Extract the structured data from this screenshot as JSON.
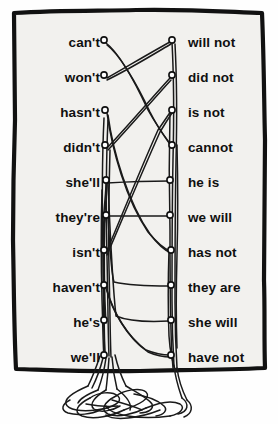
{
  "puzzle": {
    "title": "Contractions matching puzzle",
    "frame_color": "#111111",
    "background_color": "#f2f1ee",
    "string_color": "#1a1a1a",
    "text_color": "#101010",
    "rows": 10,
    "row_spacing": 35,
    "first_row_y": 43,
    "left_column": [
      {
        "label": "can't",
        "y": 43,
        "peg": {
          "x": 104,
          "y": 40
        }
      },
      {
        "label": "won't",
        "y": 78,
        "peg": {
          "x": 104,
          "y": 75
        }
      },
      {
        "label": "hasn't",
        "y": 113,
        "peg": {
          "x": 105,
          "y": 110
        }
      },
      {
        "label": "didn't",
        "y": 148,
        "peg": {
          "x": 105,
          "y": 145
        }
      },
      {
        "label": "she'll",
        "y": 183,
        "peg": {
          "x": 106,
          "y": 180
        }
      },
      {
        "label": "they're",
        "y": 218,
        "peg": {
          "x": 106,
          "y": 215
        }
      },
      {
        "label": "isn't",
        "y": 253,
        "peg": {
          "x": 104,
          "y": 250
        }
      },
      {
        "label": "haven't",
        "y": 288,
        "peg": {
          "x": 104,
          "y": 285
        }
      },
      {
        "label": "he's",
        "y": 323,
        "peg": {
          "x": 104,
          "y": 320
        }
      },
      {
        "label": "we'll",
        "y": 358,
        "peg": {
          "x": 104,
          "y": 355
        }
      }
    ],
    "right_column": [
      {
        "label": "will not",
        "y": 43,
        "peg": {
          "x": 172,
          "y": 40
        }
      },
      {
        "label": "did not",
        "y": 78,
        "peg": {
          "x": 172,
          "y": 75
        }
      },
      {
        "label": "is not",
        "y": 113,
        "peg": {
          "x": 172,
          "y": 110
        }
      },
      {
        "label": "cannot",
        "y": 148,
        "peg": {
          "x": 172,
          "y": 145
        }
      },
      {
        "label": "he is",
        "y": 183,
        "peg": {
          "x": 170,
          "y": 180
        }
      },
      {
        "label": "we will",
        "y": 218,
        "peg": {
          "x": 170,
          "y": 215
        }
      },
      {
        "label": "has not",
        "y": 253,
        "peg": {
          "x": 171,
          "y": 250
        }
      },
      {
        "label": "they are",
        "y": 288,
        "peg": {
          "x": 171,
          "y": 285
        }
      },
      {
        "label": "she will",
        "y": 323,
        "peg": {
          "x": 171,
          "y": 320
        }
      },
      {
        "label": "have not",
        "y": 358,
        "peg": {
          "x": 171,
          "y": 355
        }
      }
    ],
    "connections": [
      {
        "from": "can't",
        "to": "cannot",
        "left_index": 0,
        "right_index": 3
      },
      {
        "from": "won't",
        "to": "will not",
        "left_index": 1,
        "right_index": 0
      },
      {
        "from": "hasn't",
        "to": "has not",
        "left_index": 2,
        "right_index": 6
      },
      {
        "from": "didn't",
        "to": "did not",
        "left_index": 3,
        "right_index": 1
      },
      {
        "from": "she'll",
        "to": "she will",
        "left_index": 4,
        "right_index": 8
      },
      {
        "from": "they're",
        "to": "they are",
        "left_index": 5,
        "right_index": 7
      },
      {
        "from": "isn't",
        "to": "is not",
        "left_index": 6,
        "right_index": 2
      },
      {
        "from": "haven't",
        "to": "have not",
        "left_index": 7,
        "right_index": 9
      },
      {
        "from": "he's",
        "to": "he is",
        "left_index": 8,
        "right_index": 4
      },
      {
        "from": "we'll",
        "to": "we will",
        "left_index": 9,
        "right_index": 5
      }
    ],
    "tangle_caption": ""
  }
}
